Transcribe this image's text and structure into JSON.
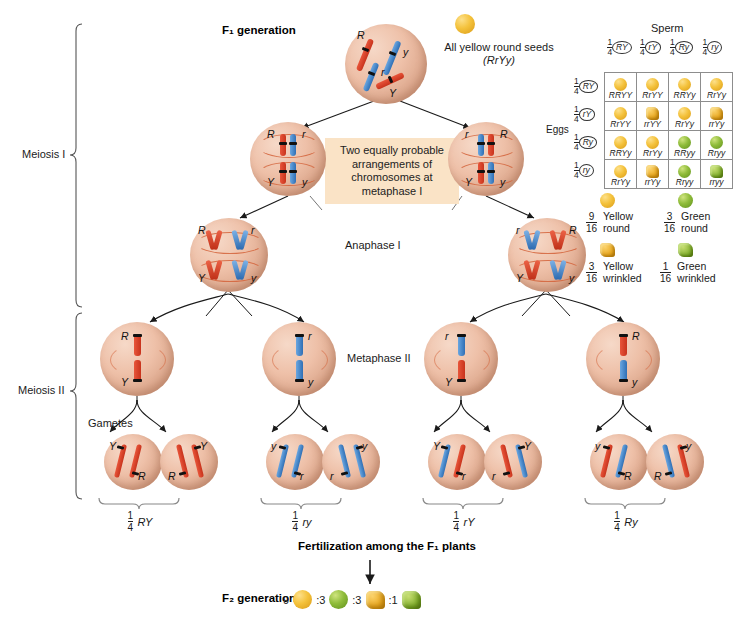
{
  "labels": {
    "f1_generation": "F₁ generation",
    "all_yellow": "All yellow round seeds",
    "all_yellow_geno": "(RrYy)",
    "meiosis_i": "Meiosis I",
    "meiosis_ii": "Meiosis II",
    "anaphase_i": "Anaphase I",
    "metaphase_ii": "Metaphase II",
    "gametes": "Gametes",
    "callout": "Two equally probable arrangements of chromosomes at metaphase I",
    "fertilization": "Fertilization among the F₁ plants",
    "f2_generation": "F₂ generation"
  },
  "f1_cell": {
    "chromosomes": [
      "R",
      "r",
      "Y",
      "y"
    ]
  },
  "metaphase_i": [
    {
      "top_left": "R",
      "top_right": "r",
      "bottom_left": "Y",
      "bottom_right": "y"
    },
    {
      "top_left": "r",
      "top_right": "R",
      "bottom_left": "Y",
      "bottom_right": "y"
    }
  ],
  "anaphase_i": [
    {
      "top_left": "R",
      "top_right": "r",
      "bottom_left": "Y",
      "bottom_right": "y"
    },
    {
      "top_left": "r",
      "top_right": "R",
      "bottom_left": "Y",
      "bottom_right": "y"
    }
  ],
  "metaphase_ii_cells": [
    {
      "top": "R",
      "bottom": "Y",
      "top_color": "red",
      "bottom_color": "red"
    },
    {
      "top": "r",
      "bottom": "y",
      "top_color": "blue",
      "bottom_color": "blue"
    },
    {
      "top": "r",
      "bottom": "Y",
      "top_color": "blue",
      "bottom_color": "red"
    },
    {
      "top": "R",
      "bottom": "y",
      "top_color": "red",
      "bottom_color": "blue"
    }
  ],
  "gamete_cells": [
    {
      "upper": "Y",
      "lower": "R"
    },
    {
      "upper": "Y",
      "lower": "R"
    },
    {
      "upper": "y",
      "lower": "r"
    },
    {
      "upper": "y",
      "lower": "r"
    },
    {
      "upper": "Y",
      "lower": "r"
    },
    {
      "upper": "Y",
      "lower": "r"
    },
    {
      "upper": "y",
      "lower": "R"
    },
    {
      "upper": "y",
      "lower": "R"
    }
  ],
  "gamete_ratios": [
    {
      "num": "1",
      "den": "4",
      "geno": "RY"
    },
    {
      "num": "1",
      "den": "4",
      "geno": "ry"
    },
    {
      "num": "1",
      "den": "4",
      "geno": "rY"
    },
    {
      "num": "1",
      "den": "4",
      "geno": "Ry"
    }
  ],
  "punnett": {
    "sperm_label": "Sperm",
    "eggs_label": "Eggs",
    "col_headers": [
      "RY",
      "rY",
      "Ry",
      "ry"
    ],
    "row_headers": [
      "RY",
      "rY",
      "Ry",
      "ry"
    ],
    "header_num": "1",
    "header_den": "4",
    "cells": [
      [
        {
          "geno": "RRYY",
          "seed": "y"
        },
        {
          "geno": "RrYY",
          "seed": "y"
        },
        {
          "geno": "RRYy",
          "seed": "y"
        },
        {
          "geno": "RrYy",
          "seed": "y"
        }
      ],
      [
        {
          "geno": "RrYY",
          "seed": "y"
        },
        {
          "geno": "rrYY",
          "seed": "wy"
        },
        {
          "geno": "RrYy",
          "seed": "y"
        },
        {
          "geno": "rrYy",
          "seed": "wy"
        }
      ],
      [
        {
          "geno": "RRYy",
          "seed": "y"
        },
        {
          "geno": "RrYy",
          "seed": "y"
        },
        {
          "geno": "RRyy",
          "seed": "g"
        },
        {
          "geno": "Rryy",
          "seed": "g"
        }
      ],
      [
        {
          "geno": "RrYy",
          "seed": "y"
        },
        {
          "geno": "rrYy",
          "seed": "wy"
        },
        {
          "geno": "Rryy",
          "seed": "g"
        },
        {
          "geno": "rryy",
          "seed": "wg"
        }
      ]
    ]
  },
  "legend": [
    {
      "num": "9",
      "den": "16",
      "line1": "Yellow",
      "line2": "round",
      "seed": "y"
    },
    {
      "num": "3",
      "den": "16",
      "line1": "Green",
      "line2": "round",
      "seed": "g"
    },
    {
      "num": "3",
      "den": "16",
      "line1": "Yellow",
      "line2": "wrinkled",
      "seed": "wy"
    },
    {
      "num": "1",
      "den": "16",
      "line1": "Green",
      "line2": "wrinkled",
      "seed": "wg"
    }
  ],
  "f2_ratio": [
    {
      "count": "9",
      "seed": "y"
    },
    {
      "count": ":3",
      "seed": "g"
    },
    {
      "count": ":3",
      "seed": "wy"
    },
    {
      "count": ":1",
      "seed": "wg"
    }
  ],
  "colors": {
    "cell_fill": "#eec0a8",
    "chromosome_red": "#d6432a",
    "chromosome_blue": "#3b7cc0",
    "callout_bg": "#fae3c6",
    "seed_yellow": "#f4c23c",
    "seed_green": "#8fbc3a"
  }
}
